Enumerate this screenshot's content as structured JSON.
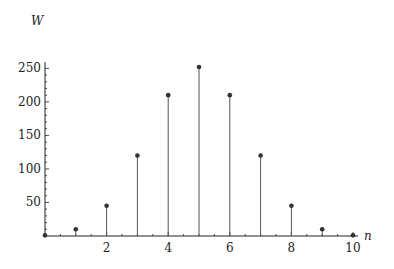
{
  "chart_data": {
    "type": "stem",
    "title": "",
    "xlabel": "n",
    "ylabel": "W",
    "x": [
      0,
      1,
      2,
      3,
      4,
      5,
      6,
      7,
      8,
      9,
      10
    ],
    "values": [
      1,
      10,
      45,
      120,
      210,
      252,
      210,
      120,
      45,
      10,
      1
    ],
    "xticks": [
      "2",
      "4",
      "6",
      "8",
      "10"
    ],
    "yticks": [
      "50",
      "100",
      "150",
      "200",
      "250"
    ],
    "xlim": [
      0,
      10
    ],
    "ylim": [
      0,
      255
    ],
    "grid": false,
    "legend": null,
    "colors": {
      "stem": "#555555",
      "marker": "#333333",
      "axis": "#222222"
    }
  }
}
